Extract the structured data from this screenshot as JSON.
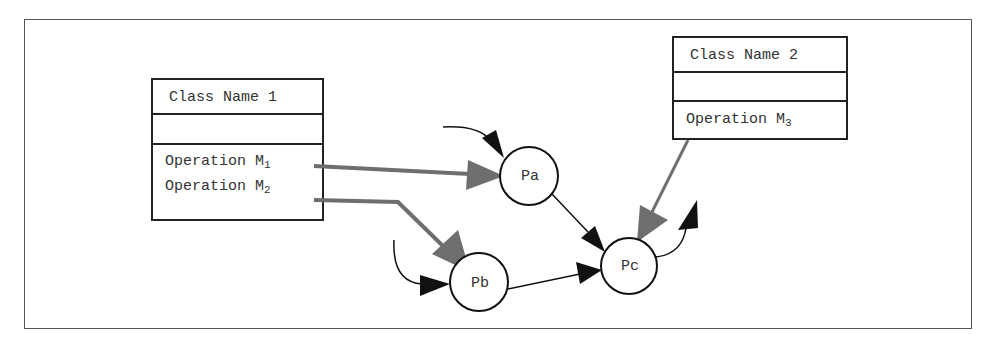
{
  "diagram": {
    "colors": {
      "frame": "#555555",
      "class_border": "#222222",
      "text": "#333333",
      "operation_link": "#6e6e6e",
      "process_flow": "#111111"
    },
    "classes": [
      {
        "name": "Class Name 1",
        "attributes": [],
        "operations": [
          {
            "label": "Operation M",
            "sub": "1"
          },
          {
            "label": "Operation M",
            "sub": "2"
          }
        ]
      },
      {
        "name": "Class Name 2",
        "attributes": [],
        "operations": [
          {
            "label": "Operation M",
            "sub": "3"
          }
        ]
      }
    ],
    "processes": [
      {
        "id": "Pa",
        "label": "Pa"
      },
      {
        "id": "Pb",
        "label": "Pb"
      },
      {
        "id": "Pc",
        "label": "Pc"
      }
    ],
    "edges": [
      {
        "from": "Operation M1",
        "to": "Pa",
        "style": "gray"
      },
      {
        "from": "Operation M2",
        "to": "Pb",
        "style": "gray"
      },
      {
        "from": "Operation M3",
        "to": "Pc",
        "style": "gray"
      },
      {
        "from": "input",
        "to": "Pa",
        "style": "black"
      },
      {
        "from": "input",
        "to": "Pb",
        "style": "black"
      },
      {
        "from": "Pa",
        "to": "Pc",
        "style": "black"
      },
      {
        "from": "Pb",
        "to": "Pc",
        "style": "black"
      },
      {
        "from": "Pc",
        "to": "output",
        "style": "black"
      }
    ]
  }
}
